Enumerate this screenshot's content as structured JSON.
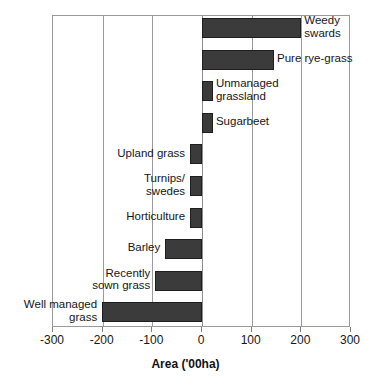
{
  "chart_data": {
    "type": "bar",
    "orientation": "horizontal",
    "title": "",
    "xlabel": "Area ('00ha)",
    "ylabel": "",
    "xlim": [
      -300,
      300
    ],
    "xticks": [
      -300,
      -200,
      -100,
      0,
      100,
      200,
      300
    ],
    "xtick_labels": [
      "-300",
      "-200",
      "-100",
      "0",
      "100",
      "200",
      "300"
    ],
    "grid": true,
    "legend": false,
    "categories": [
      "Weedy swards",
      "Pure rye-grass",
      "Unmanaged grassland",
      "Sugarbeet",
      "Upland grass",
      "Turnips/ swedes",
      "Horticulture",
      "Barley",
      "Recently sown grass",
      "Well managed grass"
    ],
    "values": [
      200,
      145,
      22,
      22,
      -24,
      -24,
      -24,
      -74,
      -94,
      -201
    ],
    "bars": [
      {
        "label": "Weedy\nswards",
        "value": 200,
        "label_side": "right"
      },
      {
        "label": "Pure rye-grass",
        "value": 145,
        "label_side": "right"
      },
      {
        "label": "Unmanaged\ngrassland",
        "value": 22,
        "label_side": "right"
      },
      {
        "label": "Sugarbeet",
        "value": 22,
        "label_side": "right"
      },
      {
        "label": "Upland grass",
        "value": -24,
        "label_side": "left"
      },
      {
        "label": "Turnips/\nswedes",
        "value": -24,
        "label_side": "left"
      },
      {
        "label": "Horticulture",
        "value": -24,
        "label_side": "left"
      },
      {
        "label": "Barley",
        "value": -74,
        "label_side": "left"
      },
      {
        "label": "Recently\nsown grass",
        "value": -94,
        "label_side": "left"
      },
      {
        "label": "Well managed\ngrass",
        "value": -201,
        "label_side": "left"
      }
    ],
    "colors": {
      "bar_fill": "#3b3b3b",
      "bar_edge": "#1e1e1e",
      "grid": "#9a9a9a",
      "text": "#151515",
      "background": "#ffffff"
    }
  },
  "axis": {
    "x_title": "Area ('00ha)"
  }
}
